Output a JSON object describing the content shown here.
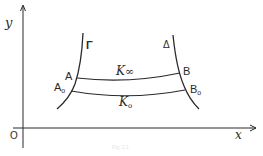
{
  "diagram": {
    "axes": {
      "x_label": "x",
      "y_label": "y",
      "origin_label": "O"
    },
    "curves": {
      "left": {
        "label": "Γ"
      },
      "right": {
        "label": "Δ"
      }
    },
    "points": {
      "A": "A",
      "A0": "A",
      "A0_sub": "o",
      "B": "B",
      "B0": "B",
      "B0_sub": "o"
    },
    "arcs": {
      "upper": {
        "label_main": "K",
        "label_sub": "∞"
      },
      "lower": {
        "label_main": "K",
        "label_sub": "o"
      }
    },
    "caption": "Fig. 2.1",
    "colors": {
      "stroke": "#2a2a2a",
      "background": "#ffffff"
    }
  }
}
